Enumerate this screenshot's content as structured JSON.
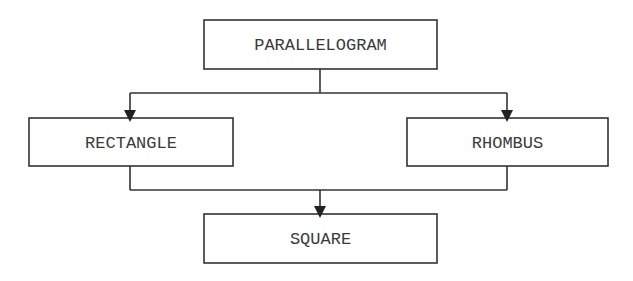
{
  "diagram": {
    "type": "hierarchy",
    "nodes": {
      "parallelogram": {
        "label": "PARALLELOGRAM"
      },
      "rectangle": {
        "label": "RECTANGLE"
      },
      "rhombus": {
        "label": "RHOMBUS"
      },
      "square": {
        "label": "SQUARE"
      }
    },
    "edges": [
      {
        "from": "PARALLELOGRAM",
        "to": "RECTANGLE"
      },
      {
        "from": "PARALLELOGRAM",
        "to": "RHOMBUS"
      },
      {
        "from": "RECTANGLE",
        "to": "SQUARE"
      },
      {
        "from": "RHOMBUS",
        "to": "SQUARE"
      }
    ],
    "colors": {
      "stroke": "#333333",
      "text": "#3a3a3a",
      "background": "#ffffff"
    }
  }
}
